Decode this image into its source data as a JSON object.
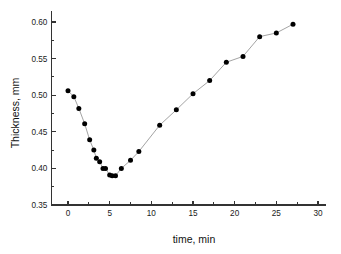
{
  "chart_data": {
    "type": "scatter",
    "title": "",
    "xlabel": "time, min",
    "ylabel": "Thickness, mm",
    "xlim": [
      -2,
      31
    ],
    "ylim": [
      0.35,
      0.615
    ],
    "grid": false,
    "legend": null,
    "marker": "filled-circle",
    "marker_color": "#000000",
    "line_color": "#8c8c8c",
    "x_ticks": [
      0,
      5,
      10,
      15,
      20,
      25,
      30
    ],
    "x_tick_labels": [
      "0",
      "5",
      "10",
      "15",
      "20",
      "25",
      "30"
    ],
    "x_minor_interval": 2.5,
    "y_ticks": [
      0.35,
      0.4,
      0.45,
      0.5,
      0.55,
      0.6
    ],
    "y_tick_labels": [
      "0.35",
      "0.40",
      "0.45",
      "0.50",
      "0.55",
      "0.60"
    ],
    "y_minor_interval": 0.025,
    "series": [
      {
        "name": "Thickness",
        "x": [
          0,
          0.7,
          1.3,
          2.0,
          2.6,
          3.1,
          3.4,
          3.8,
          4.2,
          4.5,
          5.0,
          5.3,
          5.7,
          6.4,
          7.5,
          8.5,
          11.0,
          13.0,
          15.0,
          17.0,
          19.0,
          21.0,
          23.0,
          25.0,
          27.0
        ],
        "y": [
          0.506,
          0.498,
          0.482,
          0.461,
          0.439,
          0.425,
          0.414,
          0.409,
          0.4,
          0.4,
          0.391,
          0.39,
          0.39,
          0.4,
          0.411,
          0.423,
          0.459,
          0.48,
          0.502,
          0.52,
          0.545,
          0.553,
          0.58,
          0.585,
          0.597
        ]
      }
    ]
  },
  "axes": {
    "x_title": "time, min",
    "y_title": "Thickness, mm"
  }
}
